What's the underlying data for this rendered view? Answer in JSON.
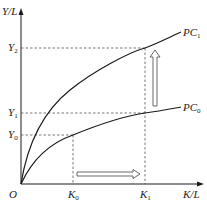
{
  "diagram": {
    "type": "economics-production-curve",
    "axes": {
      "y_label": "Y/L",
      "x_label": "K/L",
      "origin_label": "O"
    },
    "y_ticks": [
      {
        "id": "Y0",
        "base": "Y",
        "sub": "0"
      },
      {
        "id": "Y1",
        "base": "Y",
        "sub": "1"
      },
      {
        "id": "Y2",
        "base": "Y",
        "sub": "2"
      }
    ],
    "x_ticks": [
      {
        "id": "K0",
        "base": "K",
        "sub": "0"
      },
      {
        "id": "K1",
        "base": "K",
        "sub": "1"
      }
    ],
    "curves": [
      {
        "id": "PC0",
        "base": "PC",
        "sub": "0",
        "description": "lower concave production curve"
      },
      {
        "id": "PC1",
        "base": "PC",
        "sub": "1",
        "description": "upper concave production curve (shifted up)"
      }
    ],
    "arrows": [
      {
        "id": "capital-deepening-arrow",
        "direction": "right",
        "from": "K0",
        "to": "K1"
      },
      {
        "id": "technology-shift-arrow",
        "direction": "up",
        "from": "PC0",
        "to": "PC1"
      }
    ],
    "points": [
      {
        "curve": "PC0",
        "x": "K0",
        "y": "Y0"
      },
      {
        "curve": "PC0",
        "x": "K1",
        "y": "Y1"
      },
      {
        "curve": "PC1",
        "x": "K1",
        "y": "Y2"
      }
    ],
    "caption": ""
  },
  "colors": {
    "line": "#1a1a1a",
    "dashed": "#555555",
    "arrow_fill": "#ffffff",
    "arrow_stroke": "#444444"
  }
}
